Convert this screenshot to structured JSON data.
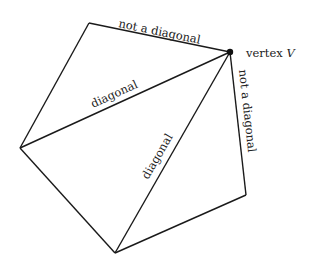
{
  "diagram": {
    "labels": {
      "top_edge": "not a diagonal",
      "right_edge": "not a diagonal",
      "diagonal_left": "diagonal",
      "diagonal_bottom": "diagonal",
      "vertex_prefix": "vertex ",
      "vertex_name": "V"
    },
    "colors": {
      "stroke": "#1a1a1a",
      "text": "#222222"
    }
  }
}
